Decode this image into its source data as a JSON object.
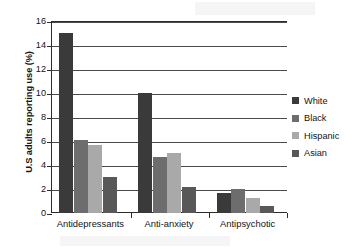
{
  "chart_data": {
    "type": "bar",
    "title": "",
    "subtitle": "",
    "xlabel": "",
    "ylabel": "U.S adults reporting use (%)",
    "categories": [
      "Antidepressants",
      "Anti-anxiety",
      "Antipsychotic"
    ],
    "series": [
      {
        "name": "White",
        "color": "#3a3a3a",
        "values": [
          15.0,
          10.0,
          1.7
        ]
      },
      {
        "name": "Black",
        "color": "#6d6d6d",
        "values": [
          6.1,
          4.7,
          2.0
        ]
      },
      {
        "name": "Hispanic",
        "color": "#a9a9a9",
        "values": [
          5.7,
          5.0,
          1.25
        ]
      },
      {
        "name": "Asian",
        "color": "#585858",
        "values": [
          3.0,
          2.2,
          0.6
        ]
      }
    ],
    "ylim": [
      0,
      16
    ],
    "y_ticks": [
      0,
      2,
      4,
      6,
      8,
      10,
      12,
      14,
      16
    ],
    "y_tick_labels": [
      "0",
      "2",
      "4",
      "6",
      "8",
      "10",
      "12",
      "14",
      "16"
    ],
    "grid": true,
    "grid_axis": "y",
    "legend_position": "right",
    "axis_color": "#2b2b2b",
    "grid_color": "#4a4a4a",
    "background_color": "#ffffff"
  }
}
